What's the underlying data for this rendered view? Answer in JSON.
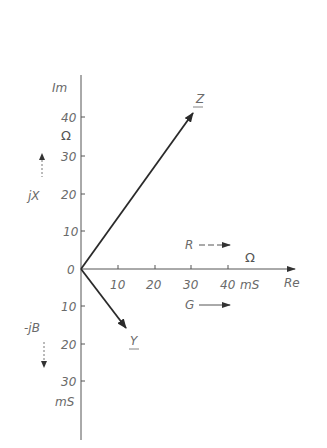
{
  "diagram": {
    "type": "phasor-diagram",
    "axes": {
      "vertical_title": "Im",
      "horizontal_title": "Re",
      "upper_unit": "Ω",
      "upper_label": "jX",
      "lower_label": "-jB",
      "lower_unit": "mS",
      "origin_label": "0",
      "upper_ticks": [
        "10",
        "20",
        "30",
        "40"
      ],
      "lower_ticks": [
        "10",
        "20",
        "30"
      ],
      "right_ticks": [
        "10",
        "20",
        "30",
        "40"
      ],
      "right_unit": "mS",
      "right_unit_ohm": "Ω"
    },
    "vectors": [
      {
        "name": "Z",
        "description": "impedance",
        "re": 30,
        "im": 41
      },
      {
        "name": "Y",
        "description": "admittance",
        "re": 12,
        "im": -16
      }
    ],
    "legend": [
      {
        "label": "R",
        "meaning": "resistance direction"
      },
      {
        "label": "G",
        "meaning": "conductance direction"
      }
    ],
    "colors": {
      "axis": "#555555",
      "vector": "#2a2a2a",
      "text": "#6a6a6a"
    }
  }
}
